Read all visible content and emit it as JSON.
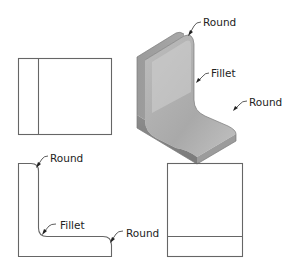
{
  "diagram": {
    "type": "orthographic-and-isometric-views",
    "views": [
      {
        "id": "front-view",
        "position": "top-left"
      },
      {
        "id": "isometric-view",
        "position": "top-right"
      },
      {
        "id": "side-view",
        "position": "bottom-left"
      },
      {
        "id": "top-view",
        "position": "bottom-right"
      }
    ],
    "labels": {
      "iso_round_top": "Round",
      "iso_fillet": "Fillet",
      "iso_round_right": "Round",
      "side_round_top": "Round",
      "side_fillet": "Fillet",
      "side_round_right": "Round"
    },
    "colors": {
      "line": "#666666",
      "shade_light": "#d9d9d9",
      "shade_mid": "#b8b8b8",
      "shade_dark": "#8f8f8f"
    }
  }
}
